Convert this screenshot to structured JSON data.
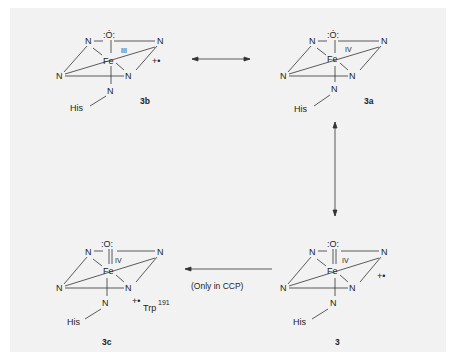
{
  "diagram": {
    "structures": [
      {
        "id": "3b",
        "label": "3b",
        "oxygen": ":Ȯ:",
        "metal": "Fe",
        "oxidation_state": "III",
        "bond": "single",
        "radical": "+•",
        "axial": "His",
        "ligand_atom": "N"
      },
      {
        "id": "3a",
        "label": "3a",
        "oxygen": ":Ȯ:",
        "metal": "Fe",
        "oxidation_state": "IV",
        "bond": "single",
        "radical": "",
        "axial": "His",
        "ligand_atom": "N"
      },
      {
        "id": "3",
        "label": "3",
        "oxygen": ":O:",
        "metal": "Fe",
        "oxidation_state": "IV",
        "bond": "double",
        "radical": "+•",
        "axial": "His",
        "ligand_atom": "N"
      },
      {
        "id": "3c",
        "label": "3c",
        "oxygen": ":O:",
        "metal": "Fe",
        "oxidation_state": "IV",
        "bond": "double",
        "radical": "+•",
        "axial": "His",
        "ligand_atom": "N",
        "residue": "Trp",
        "residue_number": "191"
      }
    ],
    "arrows": [
      {
        "from": "3b",
        "to": "3a",
        "type": "resonance",
        "label": ""
      },
      {
        "from": "3a",
        "to": "3",
        "type": "resonance",
        "label": ""
      },
      {
        "from": "3",
        "to": "3c",
        "type": "reaction",
        "label": "(Only in CCP)"
      }
    ]
  }
}
